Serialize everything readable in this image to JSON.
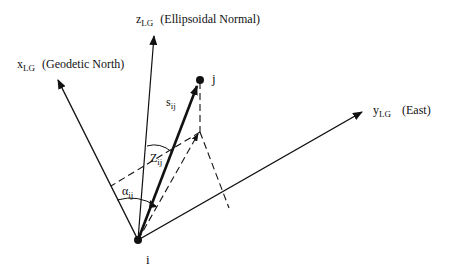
{
  "diagram": {
    "type": "local-geodetic-frame",
    "axes": {
      "x": {
        "symbol": "x",
        "subscript": "LG",
        "description": "(Geodetic North)"
      },
      "y": {
        "symbol": "y",
        "subscript": "LG",
        "description": "(East)"
      },
      "z": {
        "symbol": "z",
        "subscript": "LG",
        "description": "(Ellipsoidal Normal)"
      }
    },
    "points": {
      "origin": {
        "label": "i"
      },
      "target": {
        "label": "j"
      }
    },
    "quantities": {
      "distance": {
        "symbol": "s",
        "subscript": "ij"
      },
      "zenith": {
        "symbol": "Z",
        "subscript": "ij"
      },
      "azimuth": {
        "symbol": "α",
        "subscript": "ij"
      }
    },
    "colors": {
      "ink": "#111111",
      "background": "#ffffff"
    }
  }
}
